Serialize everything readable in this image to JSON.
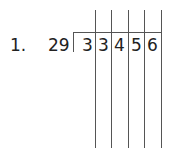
{
  "problem": {
    "number_label": "1.",
    "divisor": "29",
    "dividend_digits": [
      "3",
      "3",
      "4",
      "5",
      "6"
    ]
  }
}
